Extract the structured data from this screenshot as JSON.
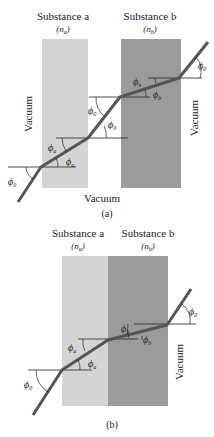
{
  "panel_a": {
    "substance_a": "Substance a",
    "substance_a_sym": "(n",
    "substance_a_sub": "a",
    "substance_b": "Substance b",
    "substance_b_sym": "(n",
    "substance_b_sub": "b",
    "vacuum_left": "Vacuum",
    "vacuum_right": "Vacuum",
    "vacuum_bottom": "Vacuum",
    "caption": "(a)",
    "angles": {
      "phi": "ϕ",
      "sub0": "0",
      "suba": "a",
      "subb": "b"
    }
  },
  "panel_b": {
    "substance_a": "Substance a",
    "substance_a_sym": "(n",
    "substance_a_sub": "a",
    "substance_b": "Substance b",
    "substance_b_sym": "(n",
    "substance_b_sub": "b",
    "vacuum_right": "Vacuum",
    "caption": "(b)"
  },
  "colors": {
    "slab_a": "#d2d2d2",
    "slab_b": "#9a9a9a",
    "ray": "#555555"
  }
}
